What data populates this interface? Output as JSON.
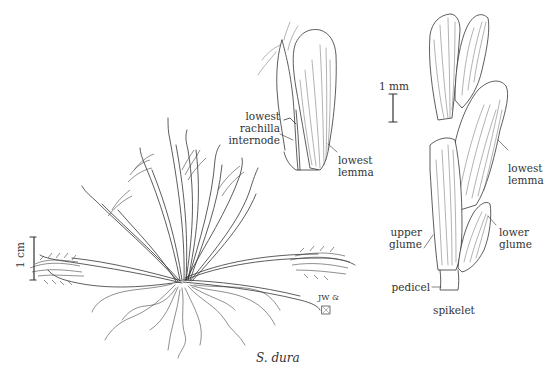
{
  "figure": {
    "caption": "S. dura",
    "scale_bars": {
      "habit": "1 cm",
      "detail": "1 mm"
    },
    "detail_labels": {
      "rachilla": "lowest\nrachilla\ninternode",
      "rachilla_lines": [
        "lowest",
        "rachilla",
        "internode"
      ],
      "lemma_upper": [
        "lowest",
        "lemma"
      ],
      "lemma_right": [
        "lowest",
        "lemma"
      ],
      "upper_glume": [
        "upper",
        "glume"
      ],
      "lower_glume": [
        "lower",
        "glume"
      ],
      "pedicel": "pedicel",
      "spikelet": "spikelet"
    },
    "signature": "JW &",
    "colors": {
      "ink": "#333333",
      "background": "#ffffff"
    }
  }
}
